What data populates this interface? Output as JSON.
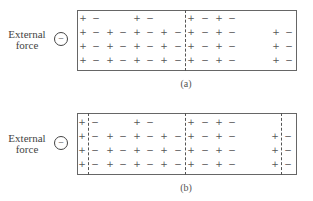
{
  "panels": [
    {
      "id": "a",
      "caption": "(a)",
      "external_force": {
        "line1": "External",
        "line2": "force",
        "charge_symbol": "−"
      },
      "dashed_lines_x": [
        185
      ],
      "rows": [
        [
          "+",
          "−",
          "",
          "",
          "+",
          "−",
          "",
          "",
          "+",
          "−",
          "+",
          "−",
          "",
          "",
          "",
          ""
        ],
        [
          "+",
          "−",
          "+",
          "−",
          "+",
          "−",
          "+",
          "−",
          "+",
          "−",
          "+",
          "−",
          "",
          "",
          "+",
          "−"
        ],
        [
          "+",
          "−",
          "+",
          "−",
          "+",
          "−",
          "+",
          "−",
          "+",
          "−",
          "+",
          "−",
          "",
          "",
          "+",
          "−"
        ],
        [
          "+",
          "−",
          "+",
          "−",
          "+",
          "−",
          "+",
          "−",
          "+",
          "−",
          "+",
          "−",
          "",
          "",
          "+",
          "−"
        ]
      ]
    },
    {
      "id": "b",
      "caption": "(b)",
      "external_force": {
        "line1": "External",
        "line2": "force",
        "charge_symbol": "−"
      },
      "dashed_lines_x": [
        88,
        185,
        281
      ],
      "rows": [
        [
          "+",
          "−",
          "",
          "",
          "+",
          "−",
          "",
          "",
          "+",
          "−",
          "+",
          "−",
          "",
          "",
          "",
          ""
        ],
        [
          "+",
          "−",
          "+",
          "−",
          "+",
          "−",
          "+",
          "−",
          "+",
          "−",
          "+",
          "−",
          "",
          "",
          "+",
          "−"
        ],
        [
          "+",
          "−",
          "+",
          "−",
          "+",
          "−",
          "+",
          "−",
          "+",
          "−",
          "+",
          "−",
          "",
          "",
          "+",
          "−"
        ],
        [
          "+",
          "−",
          "+",
          "−",
          "+",
          "−",
          "+",
          "−",
          "+",
          "−",
          "+",
          "−",
          "",
          "",
          "+",
          "−"
        ]
      ]
    }
  ]
}
